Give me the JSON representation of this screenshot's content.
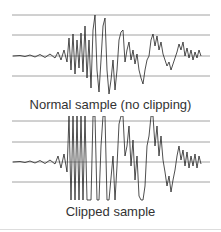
{
  "panels": [
    {
      "caption": "Normal sample (no clipping)",
      "clipped": false
    },
    {
      "caption": "Clipped sample",
      "clipped": true
    }
  ],
  "colors": {
    "gridline": "#8a8a8a",
    "waveform": "#222222",
    "text": "#333333"
  }
}
